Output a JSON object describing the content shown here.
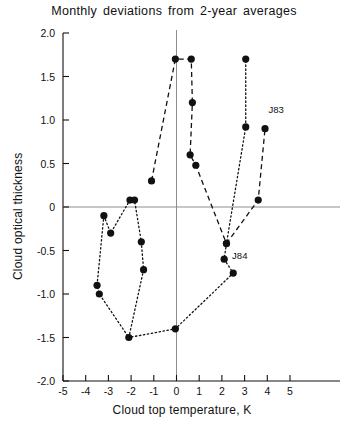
{
  "chart_data": {
    "type": "scatter",
    "title": "Monthly deviations from 2-year averages",
    "xlabel": "Cloud top temperature, K",
    "ylabel": "Cloud optical thickness",
    "xlim": [
      -5,
      5
    ],
    "ylim": [
      -2.0,
      2.0
    ],
    "grid": false,
    "legend": null,
    "xticks": [
      -5,
      -4,
      -3,
      -2,
      -1,
      0,
      1,
      2,
      3,
      4,
      5
    ],
    "xtick_labels": [
      "-5",
      "-4",
      "-3",
      "-2",
      "-1",
      "0",
      "1",
      "2",
      "3",
      "4",
      "5"
    ],
    "yticks": [
      -2.0,
      -1.5,
      -1.0,
      -0.5,
      0,
      0.5,
      1.0,
      1.5,
      2.0
    ],
    "ytick_labels": [
      "-2.0",
      "-1.5",
      "-1.0",
      "-0.5",
      "0",
      "0.5",
      "1.0",
      "1.5",
      "2.0"
    ],
    "zero_line_x": 0,
    "zero_line_y": 0,
    "series": [
      {
        "name": "dashed-path",
        "style": "dashed",
        "marker": "filled-circle",
        "points": [
          {
            "x": -1.1,
            "y": 0.3
          },
          {
            "x": -0.05,
            "y": 1.7
          },
          {
            "x": 0.65,
            "y": 1.7
          },
          {
            "x": 0.7,
            "y": 1.2
          },
          {
            "x": 0.6,
            "y": 0.6
          },
          {
            "x": 0.85,
            "y": 0.48
          },
          {
            "x": 2.2,
            "y": -0.42
          },
          {
            "x": 3.6,
            "y": 0.08
          },
          {
            "x": 3.9,
            "y": 0.9
          }
        ]
      },
      {
        "name": "dotted-path",
        "style": "dotted",
        "marker": "filled-circle",
        "points": [
          {
            "x": -3.2,
            "y": -0.1
          },
          {
            "x": -2.9,
            "y": -0.3
          },
          {
            "x": -2.05,
            "y": 0.08
          },
          {
            "x": -1.85,
            "y": 0.08
          },
          {
            "x": -1.55,
            "y": -0.4
          },
          {
            "x": -1.45,
            "y": -0.72
          },
          {
            "x": -2.1,
            "y": -1.5
          },
          {
            "x": -0.05,
            "y": -1.4
          },
          {
            "x": 2.5,
            "y": -0.76
          },
          {
            "x": 2.1,
            "y": -0.6
          },
          {
            "x": 2.2,
            "y": -0.42
          },
          {
            "x": 3.05,
            "y": 0.92
          },
          {
            "x": 3.05,
            "y": 1.7
          },
          {
            "x": -3.5,
            "y": -0.9
          },
          {
            "x": -3.4,
            "y": -1.0
          }
        ]
      }
    ],
    "annotations": [
      {
        "text": "J83",
        "x": 4.05,
        "y": 1.08
      },
      {
        "text": "J84",
        "x": 2.45,
        "y": -0.6
      }
    ]
  }
}
